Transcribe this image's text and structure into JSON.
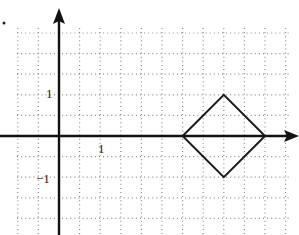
{
  "figure": {
    "type": "coordinate-grid-diagram",
    "axes": {
      "x_axis_label": "",
      "y_axis_label": "",
      "x_tick_labels": [
        {
          "text": "1",
          "value": 1
        }
      ],
      "y_tick_labels": [
        {
          "text": "1",
          "value": 1
        },
        {
          "text": "−1",
          "value": -1
        }
      ],
      "grid_squares_per_unit": 2,
      "arrowheads": [
        "positive-x",
        "positive-y"
      ]
    },
    "grid": {
      "style": "dotted",
      "x_range_units": [
        -2,
        5.75
      ],
      "y_range_units": [
        -2.5,
        2.6
      ]
    },
    "shapes": [
      {
        "name": "square (rotated 45°)",
        "vertices": [
          [
            3,
            0
          ],
          [
            4,
            1
          ],
          [
            5,
            0
          ],
          [
            4,
            -1
          ]
        ],
        "stroke": "#1a1a1a"
      }
    ],
    "marks": [
      {
        "name": "dot",
        "description": "small stray dot at top-left"
      }
    ]
  },
  "colors": {
    "background": "#ffffff",
    "axis": "#111111",
    "grid": "#8a8a8a",
    "shape": "#1a1a1a"
  }
}
